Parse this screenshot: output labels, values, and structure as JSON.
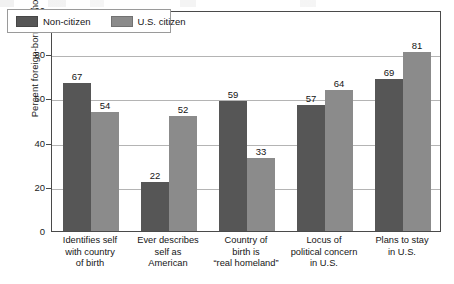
{
  "chart_data": {
    "type": "bar",
    "title": "",
    "xlabel": "",
    "ylabel": "Percent foreign-born Latinos",
    "ylim": [
      0,
      100
    ],
    "yticks": [
      0,
      20,
      40,
      60,
      80,
      100
    ],
    "grid": true,
    "legend_position": "top-left",
    "categories": [
      "Identifies self with country of birth",
      "Ever describes self as American",
      "Country of birth is “real homeland”",
      "Locus of political concern in U.S.",
      "Plans to stay in U.S."
    ],
    "category_lines": [
      [
        "Identifies self",
        "with country",
        "of birth"
      ],
      [
        "Ever describes",
        "self as",
        "American"
      ],
      [
        "Country of",
        "birth is",
        "“real homeland”"
      ],
      [
        "Locus of",
        "political concern",
        "in U.S."
      ],
      [
        "Plans to stay",
        "in U.S."
      ]
    ],
    "series": [
      {
        "name": "Non-citizen",
        "color": "#565656",
        "values": [
          67,
          22,
          59,
          57,
          69
        ]
      },
      {
        "name": "U.S. citizen",
        "color": "#8b8b8b",
        "values": [
          54,
          52,
          33,
          64,
          81
        ]
      }
    ]
  },
  "legend": {
    "items": [
      {
        "label": "Non-citizen",
        "swatch": "dark-swatch"
      },
      {
        "label": "U.S. citizen",
        "swatch": "light-swatch"
      }
    ]
  },
  "axis": {
    "y_title": "Percent foreign-born Latinos",
    "y_tick_labels": [
      "0",
      "20",
      "40",
      "60",
      "80",
      "100"
    ]
  },
  "colors": {
    "non_citizen": "#565656",
    "us_citizen": "#8b8b8b",
    "axis": "#4a4a4a",
    "grid": "#b4b4b4",
    "background": "#ffffff"
  }
}
